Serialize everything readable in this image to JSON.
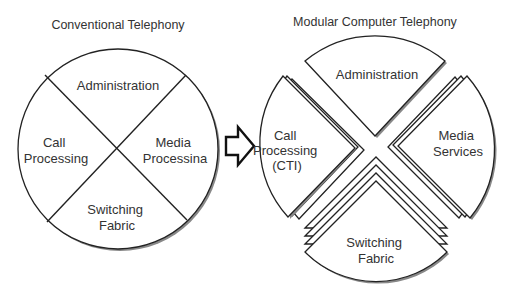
{
  "left": {
    "title": "Conventional Telephony",
    "segments": {
      "top": [
        "Administration"
      ],
      "left": [
        "Call",
        "Processing"
      ],
      "right": [
        "Media",
        "Processina"
      ],
      "bottom": [
        "Switching",
        "Fabric"
      ]
    }
  },
  "arrow": {
    "icon": "right-arrow-icon"
  },
  "right": {
    "title": "Modular Computer Telephony",
    "segments": {
      "top": [
        "Administration"
      ],
      "left": [
        "Call",
        "Processing",
        "(CTI)"
      ],
      "right": [
        "Media",
        "Services"
      ],
      "bottom": [
        "Switching",
        "Fabric"
      ]
    }
  },
  "colors": {
    "line": "#222222",
    "text": "#333333",
    "shadow": "#888888",
    "background": "#ffffff"
  }
}
